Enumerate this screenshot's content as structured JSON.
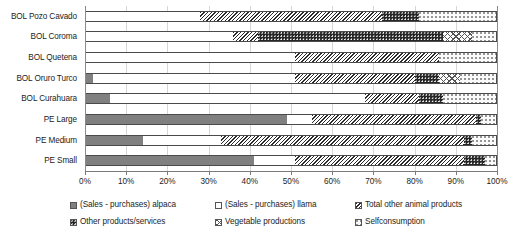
{
  "chart_data": {
    "type": "bar",
    "orientation": "horizontal",
    "stacked": true,
    "normalized": true,
    "title": "",
    "xlabel": "",
    "ylabel": "",
    "xlim": [
      0,
      100
    ],
    "grid": true,
    "legend_position": "bottom",
    "xticks": [
      "0%",
      "10%",
      "20%",
      "30%",
      "40%",
      "50%",
      "60%",
      "70%",
      "80%",
      "90%",
      "100%"
    ],
    "xtick_values": [
      0,
      10,
      20,
      30,
      40,
      50,
      60,
      70,
      80,
      90,
      100
    ],
    "categories": [
      "BOL Pozo Cavado",
      "BOL Coroma",
      "BOL Quetena",
      "BOL Oruro Turco",
      "BOL Curahuara",
      "PE Large",
      "PE Medium",
      "PE Small"
    ],
    "series": [
      {
        "name": "(Sales - purchases) alpaca",
        "pattern": "solid-gray",
        "color": "#808080",
        "values": [
          0,
          0,
          0,
          2,
          6,
          49,
          14,
          41
        ]
      },
      {
        "name": "(Sales - purchases) llama",
        "pattern": "solid-white",
        "color": "#ffffff",
        "values": [
          28,
          36,
          51,
          49,
          62,
          6,
          19,
          10
        ]
      },
      {
        "name": "Total other animal products",
        "pattern": "diagonal-hatch",
        "color": "#2b2b2b",
        "values": [
          44,
          6,
          35,
          29,
          13,
          40,
          59,
          41
        ]
      },
      {
        "name": "Other products/services",
        "pattern": "dark-dotted",
        "color": "#262626",
        "values": [
          9,
          45,
          0,
          6,
          6,
          1,
          2,
          5
        ]
      },
      {
        "name": "Vegetable productions",
        "pattern": "cross-hatch",
        "color": "#555555",
        "values": [
          0,
          7,
          0,
          5,
          0,
          0,
          0,
          0
        ]
      },
      {
        "name": "Selfconsumption",
        "pattern": "light-dots",
        "color": "#8d8d8d",
        "values": [
          19,
          6,
          14,
          9,
          13,
          4,
          6,
          3
        ]
      }
    ]
  },
  "legend": {
    "items": [
      {
        "label": "(Sales - purchases) alpaca",
        "pattern": "solid-gray"
      },
      {
        "label": "(Sales - purchases) llama",
        "pattern": "solid-white"
      },
      {
        "label": "Total other animal products",
        "pattern": "diagonal-hatch"
      },
      {
        "label": "Other products/services",
        "pattern": "dark-dotted"
      },
      {
        "label": "Vegetable productions",
        "pattern": "cross-hatch"
      },
      {
        "label": "Selfconsumption",
        "pattern": "light-dots"
      }
    ]
  }
}
